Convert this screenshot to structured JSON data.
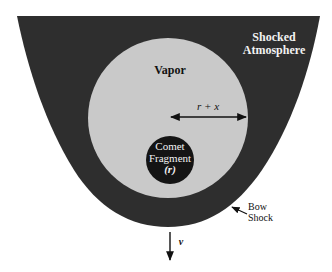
{
  "diagram": {
    "colors": {
      "shocked_atmosphere": "#2e2e2e",
      "vapor": "#c9c9c9",
      "comet_fragment": "#141414",
      "line": "#111111",
      "background": "#ffffff"
    },
    "regions": {
      "shocked_atmosphere": {
        "label_line1": "Shocked",
        "label_line2": "Atmosphere"
      },
      "vapor": {
        "label": "Vapor"
      },
      "comet_fragment": {
        "label_line1": "Comet",
        "label_line2": "Fragment",
        "label_line3": "(r)"
      }
    },
    "annotations": {
      "radius_arrow": {
        "label": "r + x"
      },
      "bow_shock": {
        "label_line1": "Bow",
        "label_line2": "Shock"
      },
      "velocity": {
        "label": "v"
      }
    }
  }
}
